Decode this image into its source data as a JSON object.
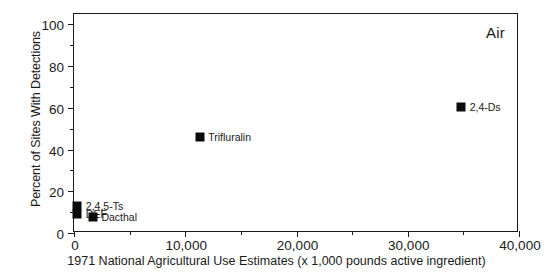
{
  "chart_data": {
    "type": "scatter",
    "title": "Air",
    "xlabel": "1971 National Agricultural Use Estimates (x 1,000 pounds active ingredient)",
    "ylabel": "Percent of Sites With Detections",
    "xlim": [
      0,
      40000
    ],
    "ylim": [
      0,
      105
    ],
    "grid": false,
    "legend": "none (points labeled inline)",
    "xticks": [
      {
        "value": 0,
        "label": "0"
      },
      {
        "value": 10000,
        "label": "10,000"
      },
      {
        "value": 20000,
        "label": "20,000"
      },
      {
        "value": 30000,
        "label": "30,000"
      },
      {
        "value": 40000,
        "label": "40,000"
      }
    ],
    "xticks_minor": [
      5000,
      15000,
      25000,
      35000
    ],
    "yticks": [
      {
        "value": 0,
        "label": "0"
      },
      {
        "value": 20,
        "label": "20"
      },
      {
        "value": 40,
        "label": "40"
      },
      {
        "value": 60,
        "label": "60"
      },
      {
        "value": 80,
        "label": "80"
      },
      {
        "value": 100,
        "label": "100"
      }
    ],
    "yticks_minor": [
      10,
      30,
      50,
      70,
      90
    ],
    "points": [
      {
        "name": "2,4,5-Ts",
        "x": 300,
        "y": 13,
        "label": "2,4,5-Ts",
        "label_pos": "right"
      },
      {
        "name": "DEF",
        "x": 300,
        "y": 9,
        "label": "DEF",
        "label_pos": "right"
      },
      {
        "name": "Dacthal",
        "x": 1700,
        "y": 7.5,
        "label": "Dacthal",
        "label_pos": "right"
      },
      {
        "name": "Trifluralin",
        "x": 11300,
        "y": 46,
        "label": "Trifluralin",
        "label_pos": "right"
      },
      {
        "name": "2,4-Ds",
        "x": 34800,
        "y": 60.5,
        "label": "2,4-Ds",
        "label_pos": "right"
      }
    ],
    "marker_color": "#0b0b0b",
    "marker_shape": "square"
  }
}
